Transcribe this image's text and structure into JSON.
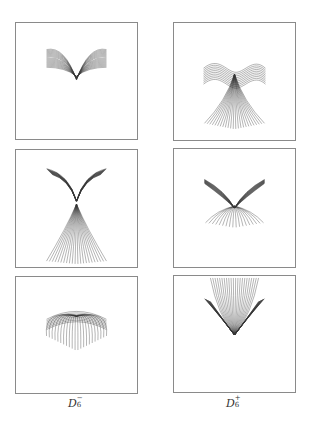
{
  "figure": {
    "panels": [
      {
        "id": "p-tl",
        "column": "left",
        "row": 1,
        "shape": "v-with-arcs"
      },
      {
        "id": "p-tr",
        "column": "right",
        "row": 1,
        "shape": "wave-with-fan"
      },
      {
        "id": "p-ml",
        "column": "left",
        "row": 2,
        "shape": "y-with-fan"
      },
      {
        "id": "p-mr",
        "column": "right",
        "row": 2,
        "shape": "v-with-drooping-arcs"
      },
      {
        "id": "p-bl",
        "column": "left",
        "row": 3,
        "shape": "dome"
      },
      {
        "id": "p-br",
        "column": "right",
        "row": 3,
        "shape": "u-with-convergence"
      }
    ],
    "curve_count": 18,
    "labels": {
      "left": {
        "base": "D",
        "sub": "6",
        "sup": "−"
      },
      "right": {
        "base": "D",
        "sub": "6",
        "sup": "+"
      }
    }
  }
}
